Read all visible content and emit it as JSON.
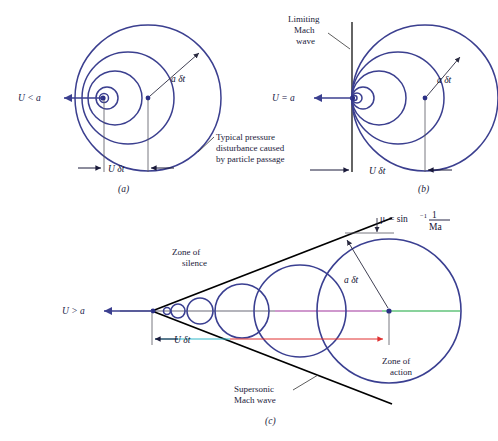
{
  "figure": {
    "colors": {
      "wave_circle": "#3b3f8f",
      "mach_line": "#000000",
      "axis_gray": "#6b6b78",
      "axis_magenta": "#a0329b",
      "axis_green": "#15a63a",
      "dim_red": "#e03030",
      "dim_cyan": "#30b8c8",
      "text": "#1a1a3a",
      "background": "#ffffff"
    }
  },
  "panel_a": {
    "caption": "(a)",
    "speed_label": "U < a",
    "radius_label": "a δt",
    "distance_label": "U δt",
    "annotation_lines": [
      "Typical pressure",
      "disturbance caused",
      "by particle passage"
    ]
  },
  "panel_b": {
    "caption": "(b)",
    "speed_label": "U = a",
    "radius_label": "a δt",
    "distance_label": "U δt",
    "wave_label_lines": [
      "Limiting",
      "Mach",
      "wave"
    ]
  },
  "panel_c": {
    "caption": "(c)",
    "speed_label": "U > a",
    "radius_label": "a δt",
    "distance_label": "U δt",
    "zone_silence_lines": [
      "Zone of",
      "silence"
    ],
    "zone_action_lines": [
      "Zone of",
      "action"
    ],
    "mach_wave_lines": [
      "Supersonic",
      "Mach wave"
    ],
    "mach_angle": {
      "mu": "μ",
      "equals": "= sin",
      "exponent": "−1",
      "numerator": "1",
      "denominator": "Ma"
    }
  }
}
